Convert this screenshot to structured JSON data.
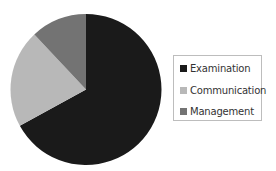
{
  "chart_data": {
    "type": "pie",
    "title": "",
    "categories": [
      "Examination",
      "Communication",
      "Management"
    ],
    "values": [
      67,
      21,
      12
    ],
    "colors": [
      "#1a1a1a",
      "#b8b8b8",
      "#737373"
    ],
    "start_angle_deg": 0,
    "direction": "clockwise",
    "legend_position": "right"
  },
  "legend": {
    "items": [
      {
        "label": "Examination",
        "color": "#1a1a1a"
      },
      {
        "label": "Communication",
        "color": "#b8b8b8"
      },
      {
        "label": "Management",
        "color": "#737373"
      }
    ]
  }
}
